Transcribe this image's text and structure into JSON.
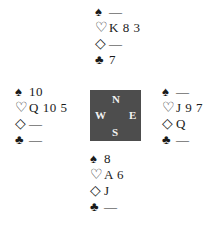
{
  "diagram": {
    "type": "bridge-deal",
    "compass": {
      "north": "N",
      "south": "S",
      "east": "E",
      "west": "W",
      "background": "#4d4d4d"
    },
    "suit_symbols": {
      "spades": "♠",
      "hearts": "♡",
      "diamonds": "◇",
      "clubs": "♣"
    },
    "hands": {
      "north": {
        "spades": "—",
        "hearts": "K 8 3",
        "diamonds": "—",
        "clubs": "7"
      },
      "west": {
        "spades": "10",
        "hearts": "Q 10 5",
        "diamonds": "—",
        "clubs": "—"
      },
      "east": {
        "spades": "—",
        "hearts": "J 9 7",
        "diamonds": "Q",
        "clubs": "—"
      },
      "south": {
        "spades": "8",
        "hearts": "A 6",
        "diamonds": "J",
        "clubs": "—"
      }
    }
  }
}
